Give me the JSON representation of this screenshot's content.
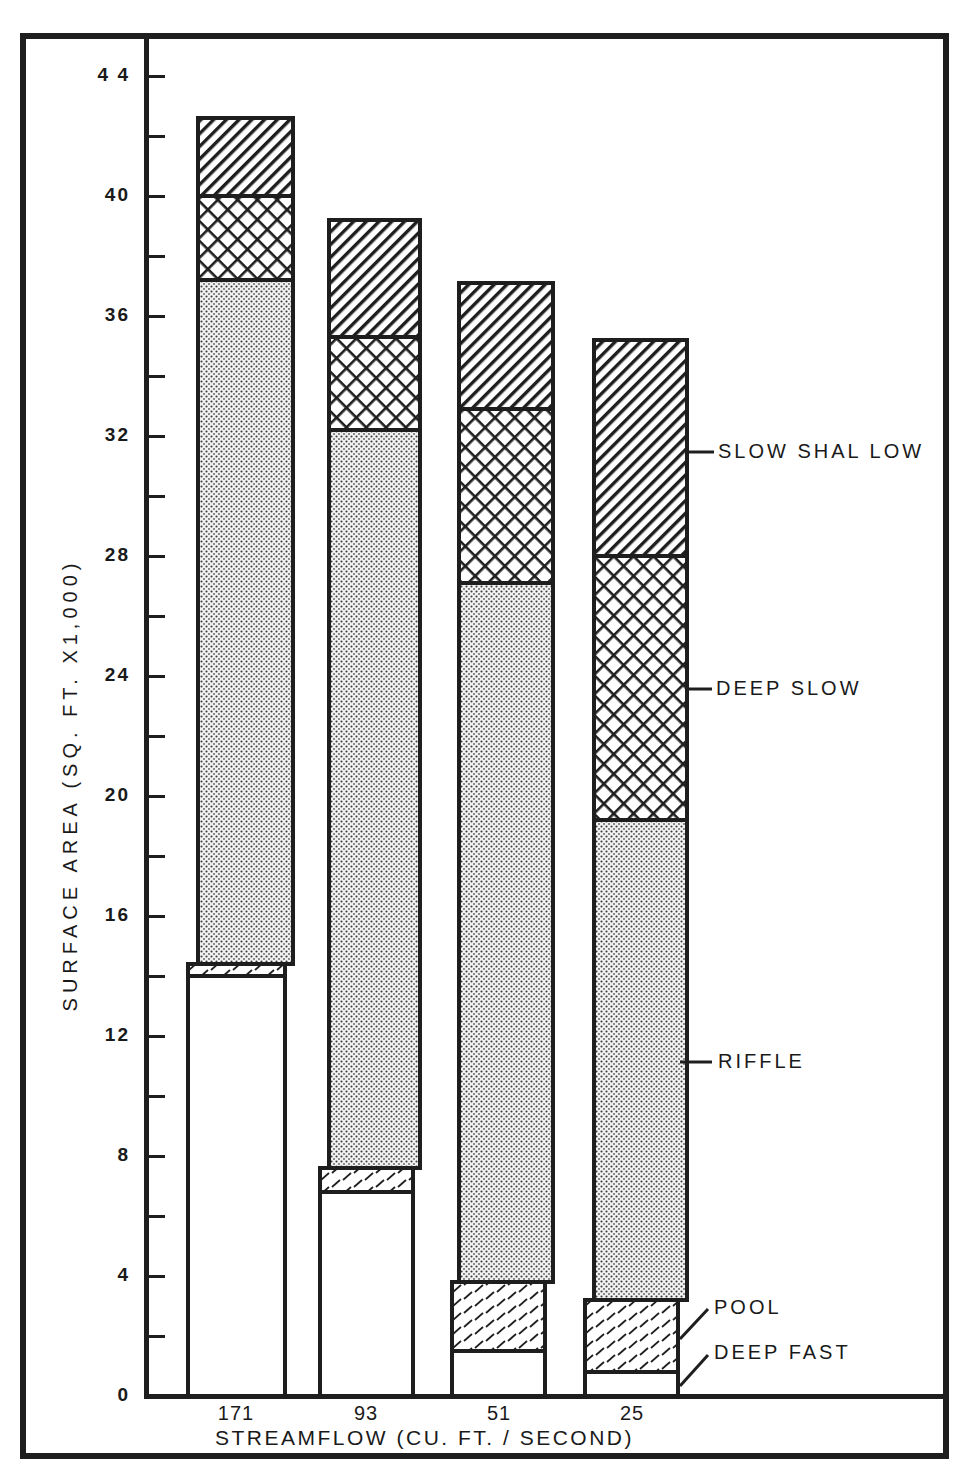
{
  "chart_data": {
    "type": "bar",
    "stacked": true,
    "title": "",
    "xlabel": "STREAMFLOW (CU. FT. / SECOND)",
    "ylabel": "SURFACE AREA (SQ. FT. X1,000)",
    "ylim": [
      0,
      44
    ],
    "yticks": [
      0,
      4,
      8,
      12,
      16,
      20,
      24,
      28,
      32,
      36,
      40,
      44
    ],
    "ytick_labels": [
      "0",
      "4",
      "8",
      "12",
      "16",
      "20",
      "24",
      "28",
      "32",
      "36",
      "40",
      "4 4"
    ],
    "grid": false,
    "legend_position": "right (leader lines from last bar)",
    "categories": [
      "171",
      "93",
      "51",
      "25"
    ],
    "series": [
      {
        "name": "DEEP FAST",
        "pattern": "blank",
        "values": [
          14.0,
          6.8,
          1.5,
          0.8
        ]
      },
      {
        "name": "POOL",
        "pattern": "sparse-dash-hatch",
        "values": [
          0.4,
          0.8,
          2.3,
          2.4
        ]
      },
      {
        "name": "RIFFLE",
        "pattern": "dot-stipple",
        "values": [
          22.8,
          24.6,
          23.3,
          16.0
        ]
      },
      {
        "name": "DEEP SLOW",
        "pattern": "cross-hatch",
        "values": [
          2.8,
          3.1,
          5.8,
          8.8
        ]
      },
      {
        "name": "SLOW SHALLOW",
        "pattern": "diagonal-hatch",
        "values": [
          2.6,
          3.9,
          4.2,
          7.2
        ]
      }
    ],
    "cumulative_tops": [
      [
        14.0,
        14.4,
        37.2,
        40.0,
        42.6
      ],
      [
        6.8,
        7.6,
        32.2,
        35.3,
        39.2
      ],
      [
        1.5,
        3.8,
        27.1,
        32.9,
        37.1
      ],
      [
        0.8,
        3.2,
        19.2,
        28.0,
        35.2
      ]
    ]
  },
  "axes": {
    "y_title": "SURFACE AREA (SQ. FT. X1,000)",
    "x_title": "STREAMFLOW (CU. FT. / SECOND)",
    "y_labels": [
      {
        "v": 44,
        "t": "4 4"
      },
      {
        "v": 40,
        "t": "40"
      },
      {
        "v": 36,
        "t": "36"
      },
      {
        "v": 32,
        "t": "32"
      },
      {
        "v": 28,
        "t": "28"
      },
      {
        "v": 24,
        "t": "24"
      },
      {
        "v": 20,
        "t": "20"
      },
      {
        "v": 16,
        "t": "16"
      },
      {
        "v": 12,
        "t": "12"
      },
      {
        "v": 8,
        "t": "8"
      },
      {
        "v": 4,
        "t": "4"
      },
      {
        "v": 0,
        "t": "0"
      }
    ],
    "x_labels": [
      "171",
      "93",
      "51",
      "25"
    ]
  },
  "legend": {
    "slow_shallow": "SLOW  SHAL LOW",
    "deep_slow": "DEEP  SLOW",
    "riffle": "RIFFLE",
    "pool": "POOL",
    "deep_fast": "DEEP  FAST"
  },
  "colors": {
    "ink": "#1e1e1e",
    "paper": "#ffffff"
  }
}
